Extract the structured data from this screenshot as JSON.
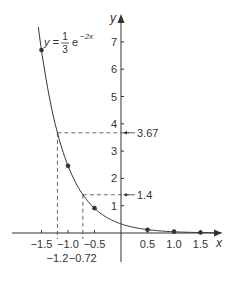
{
  "chart_data": {
    "type": "line",
    "title": "",
    "equation": {
      "lhs": "y =",
      "numerator": "1",
      "denominator": "3",
      "base": "e",
      "exponent": "−2x"
    },
    "xlabel": "x",
    "ylabel": "y",
    "xlim": [
      -1.6,
      1.9
    ],
    "ylim": [
      -1.0,
      8.2
    ],
    "grid": false,
    "x_ticks": [
      -1.5,
      -1.0,
      -0.5,
      0.5,
      1.0,
      1.5
    ],
    "x_tick_labels": [
      "−1.5",
      "−1.0",
      "−0.5",
      "0.5",
      "1.0",
      "1.5"
    ],
    "y_ticks": [
      1,
      2,
      3,
      4,
      5,
      6,
      7
    ],
    "y_tick_labels": [
      "1",
      "2",
      "3",
      "4",
      "5",
      "6",
      "7"
    ],
    "series": [
      {
        "name": "y = (1/3)e^(−2x)",
        "function": "(1/3)*exp(-2x)",
        "color": "#333333",
        "x_range": [
          -1.56,
          1.9
        ]
      }
    ],
    "points": [
      {
        "x": -1.5,
        "y": 6.7
      },
      {
        "x": -1.0,
        "y": 2.46
      },
      {
        "x": -0.5,
        "y": 0.91
      },
      {
        "x": 0.5,
        "y": 0.12
      },
      {
        "x": 1.0,
        "y": 0.05
      },
      {
        "x": 1.5,
        "y": 0.02
      }
    ],
    "annotations": [
      {
        "type": "dashed-guide",
        "x": -1.2,
        "y": 3.67,
        "x_label": "−1.2",
        "y_label": "3.67"
      },
      {
        "type": "dashed-guide",
        "x": -0.72,
        "y": 1.4,
        "x_label": "−0.72",
        "y_label": "1.4"
      }
    ]
  },
  "colors": {
    "ink": "#333333",
    "dash": "#666666"
  }
}
